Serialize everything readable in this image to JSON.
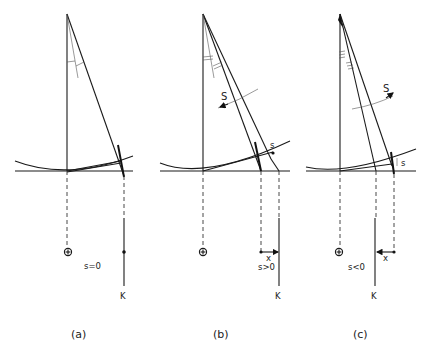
{
  "panels": [
    {
      "id": "a",
      "caption": "(a)",
      "condition": "s=0",
      "k_label": "K",
      "s_label": "",
      "x_label": ""
    },
    {
      "id": "b",
      "caption": "(b)",
      "condition": "s>0",
      "k_label": "K",
      "s_label": "S",
      "s_small_label": "s",
      "x_label": "x"
    },
    {
      "id": "c",
      "caption": "(c)",
      "condition": "s<0",
      "k_label": "K",
      "s_label": "S",
      "s_small_label": "s",
      "x_label": "x"
    }
  ],
  "symbols": {
    "origin_marker": "circle-plus"
  }
}
